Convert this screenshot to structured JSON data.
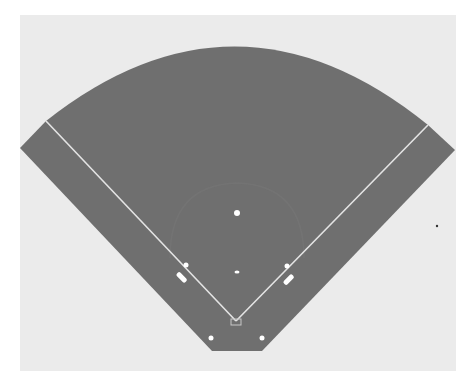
{
  "diagram": {
    "colors": {
      "page_background": "#ffffff",
      "panel_background": "#ebebeb",
      "field": "#6f6f6f",
      "infield_arc": "#767676",
      "foul_lines": "#e4e4e4",
      "markers": "#ffffff",
      "stray_dot": "#333333"
    },
    "elements": [
      {
        "name": "outfield-grass",
        "type": "fan-shaped field"
      },
      {
        "name": "left-foul-line",
        "type": "line"
      },
      {
        "name": "right-foul-line",
        "type": "line"
      },
      {
        "name": "second-base",
        "type": "marker"
      },
      {
        "name": "pitchers-mound",
        "type": "marker"
      },
      {
        "name": "third-base",
        "type": "marker"
      },
      {
        "name": "first-base",
        "type": "marker"
      },
      {
        "name": "third-base-coach-box",
        "type": "marker"
      },
      {
        "name": "first-base-coach-box",
        "type": "marker"
      },
      {
        "name": "home-plate",
        "type": "marker"
      },
      {
        "name": "on-deck-circle-left",
        "type": "marker"
      },
      {
        "name": "on-deck-circle-right",
        "type": "marker"
      }
    ]
  }
}
